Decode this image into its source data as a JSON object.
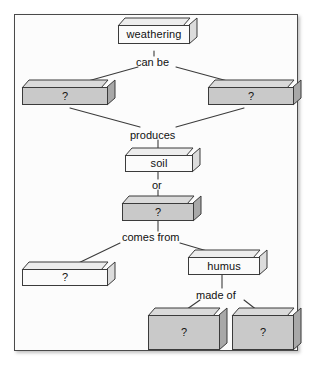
{
  "diagram": {
    "background_color": "#ffffff",
    "frame_color": "#4a4a4a",
    "box_light_fill": "#fbfbfb",
    "box_gray_fill": "#c9c9c9",
    "outline_color": "#3b3b3b",
    "text_color": "#111111",
    "nodes": [
      {
        "id": "weathering",
        "label": "weathering",
        "style": "light",
        "x": 118,
        "y": 18,
        "w": 72,
        "h": 26
      },
      {
        "id": "branch-left",
        "label": "?",
        "style": "gray",
        "x": 22,
        "y": 80,
        "w": 86,
        "h": 25
      },
      {
        "id": "branch-right",
        "label": "?",
        "style": "gray",
        "x": 208,
        "y": 80,
        "w": 86,
        "h": 25
      },
      {
        "id": "soil",
        "label": "soil",
        "style": "light",
        "x": 125,
        "y": 148,
        "w": 68,
        "h": 24
      },
      {
        "id": "soil-component",
        "label": "?",
        "style": "gray",
        "x": 122,
        "y": 196,
        "w": 72,
        "h": 25
      },
      {
        "id": "source-left",
        "label": "?",
        "style": "light",
        "x": 22,
        "y": 262,
        "w": 86,
        "h": 24
      },
      {
        "id": "humus",
        "label": "humus",
        "style": "light",
        "x": 188,
        "y": 250,
        "w": 72,
        "h": 25
      },
      {
        "id": "humus-part-left",
        "label": "?",
        "style": "gray",
        "x": 148,
        "y": 308,
        "w": 72,
        "h": 42
      },
      {
        "id": "humus-part-right",
        "label": "?",
        "style": "gray",
        "x": 232,
        "y": 308,
        "w": 62,
        "h": 42
      }
    ],
    "connector_labels": [
      {
        "id": "can-be",
        "text": "can be",
        "x": 136,
        "y": 57
      },
      {
        "id": "produces",
        "text": "produces",
        "x": 130,
        "y": 130
      },
      {
        "id": "or",
        "text": "or",
        "x": 152,
        "y": 180
      },
      {
        "id": "comes-from",
        "text": "comes from",
        "x": 122,
        "y": 232
      },
      {
        "id": "made-of",
        "text": "made of",
        "x": 196,
        "y": 290
      }
    ]
  }
}
